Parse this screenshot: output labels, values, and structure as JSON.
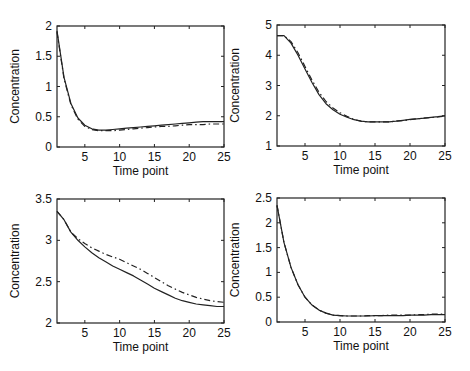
{
  "figure": {
    "caption_fragment": "..."
  },
  "chart_data": [
    {
      "type": "line",
      "panel": "top-left",
      "title": "",
      "xlabel": "Time point",
      "ylabel": "Concentration",
      "xlim": [
        1,
        25
      ],
      "ylim": [
        0,
        2
      ],
      "xticks": [
        5,
        10,
        15,
        20,
        25
      ],
      "yticks": [
        0,
        0.5,
        1,
        1.5,
        2
      ],
      "ytick_labels": [
        "0",
        "0.5",
        "1",
        "1.5",
        "2"
      ],
      "grid": false,
      "legend": null,
      "box": {
        "left": 57,
        "top": 26,
        "right": 224,
        "bottom": 147
      },
      "series": [
        {
          "name": "solid",
          "style": "solid",
          "x": [
            1,
            2,
            3,
            4,
            5,
            6,
            7,
            8,
            9,
            10,
            11,
            12,
            13,
            14,
            15,
            16,
            17,
            18,
            19,
            20,
            21,
            22,
            23,
            24,
            25
          ],
          "values": [
            1.92,
            1.15,
            0.72,
            0.48,
            0.36,
            0.3,
            0.28,
            0.28,
            0.29,
            0.3,
            0.31,
            0.32,
            0.33,
            0.34,
            0.35,
            0.36,
            0.37,
            0.38,
            0.39,
            0.4,
            0.41,
            0.42,
            0.42,
            0.42,
            0.42
          ]
        },
        {
          "name": "dash-dot",
          "style": "dashdot",
          "x": [
            1,
            2,
            3,
            4,
            5,
            6,
            7,
            8,
            9,
            10,
            11,
            12,
            13,
            14,
            15,
            16,
            17,
            18,
            19,
            20,
            21,
            22,
            23,
            24,
            25
          ],
          "values": [
            1.9,
            1.13,
            0.7,
            0.46,
            0.34,
            0.29,
            0.27,
            0.27,
            0.27,
            0.28,
            0.29,
            0.3,
            0.31,
            0.32,
            0.33,
            0.34,
            0.34,
            0.35,
            0.36,
            0.37,
            0.37,
            0.37,
            0.38,
            0.38,
            0.38
          ]
        }
      ]
    },
    {
      "type": "line",
      "panel": "top-right",
      "title": "",
      "xlabel": "Time point",
      "ylabel": "Concentration",
      "xlim": [
        1,
        25
      ],
      "ylim": [
        1,
        5
      ],
      "xticks": [
        5,
        10,
        15,
        20,
        25
      ],
      "yticks": [
        1,
        2,
        3,
        4,
        5
      ],
      "ytick_labels": [
        "1",
        "2",
        "3",
        "4",
        "5"
      ],
      "grid": false,
      "legend": null,
      "box": {
        "left": 277,
        "top": 25,
        "right": 445,
        "bottom": 146
      },
      "series": [
        {
          "name": "solid",
          "style": "solid",
          "x": [
            1,
            2,
            3,
            4,
            5,
            6,
            7,
            8,
            9,
            10,
            11,
            12,
            13,
            14,
            15,
            16,
            17,
            18,
            19,
            20,
            21,
            22,
            23,
            24,
            25
          ],
          "values": [
            4.65,
            4.65,
            4.4,
            4.0,
            3.55,
            3.1,
            2.7,
            2.4,
            2.2,
            2.05,
            1.95,
            1.87,
            1.82,
            1.8,
            1.8,
            1.8,
            1.8,
            1.82,
            1.85,
            1.88,
            1.9,
            1.92,
            1.95,
            1.97,
            2.0
          ]
        },
        {
          "name": "dash-dot",
          "style": "dashdot",
          "x": [
            1,
            2,
            3,
            4,
            5,
            6,
            7,
            8,
            9,
            10,
            11,
            12,
            13,
            14,
            15,
            16,
            17,
            18,
            19,
            20,
            21,
            22,
            23,
            24,
            25
          ],
          "values": [
            4.65,
            4.65,
            4.45,
            4.08,
            3.63,
            3.18,
            2.78,
            2.47,
            2.26,
            2.1,
            1.98,
            1.88,
            1.82,
            1.8,
            1.8,
            1.8,
            1.8,
            1.82,
            1.84,
            1.87,
            1.9,
            1.92,
            1.94,
            1.96,
            1.99
          ]
        }
      ]
    },
    {
      "type": "line",
      "panel": "bottom-left",
      "title": "",
      "xlabel": "Time point",
      "ylabel": "Concentration",
      "xlim": [
        1,
        25
      ],
      "ylim": [
        2,
        3.5
      ],
      "xticks": [
        5,
        10,
        15,
        20,
        25
      ],
      "yticks": [
        2,
        2.5,
        3,
        3.5
      ],
      "ytick_labels": [
        "2",
        "2.5",
        "3",
        "3.5"
      ],
      "grid": false,
      "legend": null,
      "box": {
        "left": 57,
        "top": 199,
        "right": 224,
        "bottom": 323
      },
      "series": [
        {
          "name": "solid",
          "style": "solid",
          "x": [
            1,
            2,
            3,
            4,
            5,
            6,
            7,
            8,
            9,
            10,
            11,
            12,
            13,
            14,
            15,
            16,
            17,
            18,
            19,
            20,
            21,
            22,
            23,
            24,
            25
          ],
          "values": [
            3.35,
            3.25,
            3.1,
            3.0,
            2.92,
            2.85,
            2.79,
            2.74,
            2.69,
            2.65,
            2.61,
            2.57,
            2.52,
            2.47,
            2.42,
            2.38,
            2.34,
            2.3,
            2.27,
            2.25,
            2.23,
            2.22,
            2.21,
            2.2,
            2.2
          ]
        },
        {
          "name": "dash-dot",
          "style": "dashdot",
          "x": [
            1,
            2,
            3,
            4,
            5,
            6,
            7,
            8,
            9,
            10,
            11,
            12,
            13,
            14,
            15,
            16,
            17,
            18,
            19,
            20,
            21,
            22,
            23,
            24,
            25
          ],
          "values": [
            3.35,
            3.25,
            3.1,
            3.02,
            2.96,
            2.91,
            2.87,
            2.83,
            2.8,
            2.77,
            2.73,
            2.69,
            2.65,
            2.6,
            2.55,
            2.5,
            2.45,
            2.41,
            2.37,
            2.34,
            2.31,
            2.29,
            2.27,
            2.26,
            2.25
          ]
        }
      ]
    },
    {
      "type": "line",
      "panel": "bottom-right",
      "title": "",
      "xlabel": "Time point",
      "ylabel": "Concentration",
      "xlim": [
        1,
        25
      ],
      "ylim": [
        0,
        2.5
      ],
      "xticks": [
        5,
        10,
        15,
        20,
        25
      ],
      "yticks": [
        0,
        0.5,
        1,
        1.5,
        2,
        2.5
      ],
      "ytick_labels": [
        "0",
        "0.5",
        "1",
        "1.5",
        "2",
        "2.5"
      ],
      "grid": false,
      "legend": null,
      "box": {
        "left": 277,
        "top": 198,
        "right": 445,
        "bottom": 322
      },
      "series": [
        {
          "name": "solid",
          "style": "solid",
          "x": [
            1,
            2,
            3,
            4,
            5,
            6,
            7,
            8,
            9,
            10,
            11,
            12,
            13,
            14,
            15,
            16,
            17,
            18,
            19,
            20,
            21,
            22,
            23,
            24,
            25
          ],
          "values": [
            2.35,
            1.6,
            1.1,
            0.75,
            0.5,
            0.34,
            0.24,
            0.18,
            0.14,
            0.13,
            0.12,
            0.12,
            0.12,
            0.12,
            0.13,
            0.13,
            0.13,
            0.13,
            0.13,
            0.14,
            0.14,
            0.14,
            0.15,
            0.15,
            0.15
          ]
        },
        {
          "name": "dash-dot",
          "style": "dashdot",
          "x": [
            1,
            2,
            3,
            4,
            5,
            6,
            7,
            8,
            9,
            10,
            11,
            12,
            13,
            14,
            15,
            16,
            17,
            18,
            19,
            20,
            21,
            22,
            23,
            24,
            25
          ],
          "values": [
            2.35,
            1.6,
            1.1,
            0.75,
            0.5,
            0.34,
            0.24,
            0.18,
            0.14,
            0.13,
            0.12,
            0.12,
            0.12,
            0.13,
            0.13,
            0.13,
            0.14,
            0.14,
            0.14,
            0.14,
            0.15,
            0.15,
            0.16,
            0.16,
            0.16
          ]
        }
      ]
    }
  ]
}
